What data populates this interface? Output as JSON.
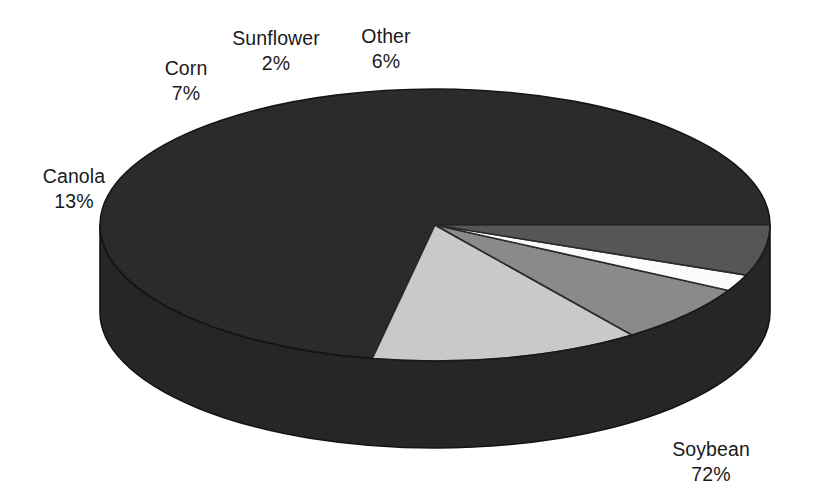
{
  "chart_data": {
    "type": "pie",
    "title": "",
    "subtitle": "",
    "xlabel": "",
    "ylabel": "",
    "legend_position": "none",
    "grid": false,
    "three_d": true,
    "units": "percent",
    "categories": [
      "Soybean",
      "Canola",
      "Corn",
      "Sunflower",
      "Other"
    ],
    "values": [
      72,
      13,
      7,
      2,
      6
    ],
    "slices": [
      {
        "label": "Soybean",
        "value": 72,
        "value_text": "72%",
        "color": "#2b2b2b",
        "side_color": "#262626"
      },
      {
        "label": "Canola",
        "value": 13,
        "value_text": "13%",
        "color": "#c9c9c9",
        "side_color": "#262626"
      },
      {
        "label": "Corn",
        "value": 7,
        "value_text": "7%",
        "color": "#8a8a8a",
        "side_color": "#262626"
      },
      {
        "label": "Sunflower",
        "value": 2,
        "value_text": "2%",
        "color": "#fbfbfb",
        "side_color": "#262626"
      },
      {
        "label": "Other",
        "value": 6,
        "value_text": "6%",
        "color": "#565656",
        "side_color": "#262626"
      }
    ],
    "annotations": [
      {
        "name": "Canola",
        "value_text": "13%"
      },
      {
        "name": "Corn",
        "value_text": "7%"
      },
      {
        "name": "Sunflower",
        "value_text": "2%"
      },
      {
        "name": "Other",
        "value_text": "6%"
      },
      {
        "name": "Soybean",
        "value_text": "72%"
      }
    ],
    "colors": {
      "background": "#ffffff",
      "outline": "#1c1c1c",
      "text": "#1a1a1a"
    }
  },
  "labels": {
    "canola": {
      "name": "Canola",
      "pct": "13%"
    },
    "corn": {
      "name": "Corn",
      "pct": "7%"
    },
    "sunflower": {
      "name": "Sunflower",
      "pct": "2%"
    },
    "other": {
      "name": "Other",
      "pct": "6%"
    },
    "soybean": {
      "name": "Soybean",
      "pct": "72%"
    }
  }
}
